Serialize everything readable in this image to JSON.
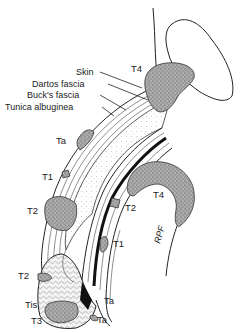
{
  "figure": {
    "anatomy_labels": [
      {
        "id": "skin",
        "text": "Skin"
      },
      {
        "id": "dartos",
        "text": "Dartos fascia"
      },
      {
        "id": "bucks",
        "text": "Buck's fascia"
      },
      {
        "id": "tunica",
        "text": "Tunica albuginea"
      }
    ],
    "stage_labels": [
      {
        "id": "t4-top",
        "text": "T4"
      },
      {
        "id": "ta-upper",
        "text": "Ta"
      },
      {
        "id": "t1-upper",
        "text": "T1"
      },
      {
        "id": "t2-upper-left",
        "text": "T2"
      },
      {
        "id": "t4-right",
        "text": "T4"
      },
      {
        "id": "t2-right",
        "text": "T2"
      },
      {
        "id": "t1-lower",
        "text": "T1"
      },
      {
        "id": "t2-glans",
        "text": "T2"
      },
      {
        "id": "tis",
        "text": "Tis"
      },
      {
        "id": "t3",
        "text": "T3"
      },
      {
        "id": "ta-lower-1",
        "text": "Ta"
      },
      {
        "id": "ta-lower-2",
        "text": "Ta"
      }
    ],
    "signature": "RPF"
  },
  "colors": {
    "ink": "#222222",
    "tumor_fill": "#9a9a9a",
    "background": "#ffffff"
  }
}
